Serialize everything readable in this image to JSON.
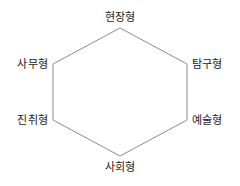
{
  "diagram": {
    "type": "hexagon",
    "title": "",
    "stroke_color": "#8c8c8c",
    "background_color": "#ffffff",
    "label_color": "#1a1a1a",
    "vertices": [
      {
        "id": "top",
        "label": "현장형",
        "x": 120,
        "y": 28
      },
      {
        "id": "right-top",
        "label": "탐구형",
        "x": 187,
        "y": 64
      },
      {
        "id": "right-bottom",
        "label": "예술형",
        "x": 187,
        "y": 120
      },
      {
        "id": "bottom",
        "label": "사회형",
        "x": 120,
        "y": 156
      },
      {
        "id": "left-bottom",
        "label": "진취형",
        "x": 53,
        "y": 120
      },
      {
        "id": "left-top",
        "label": "사무형",
        "x": 53,
        "y": 64
      }
    ],
    "polygon_points": "120,28 187,64 187,120 120,156 53,120 53,64"
  }
}
